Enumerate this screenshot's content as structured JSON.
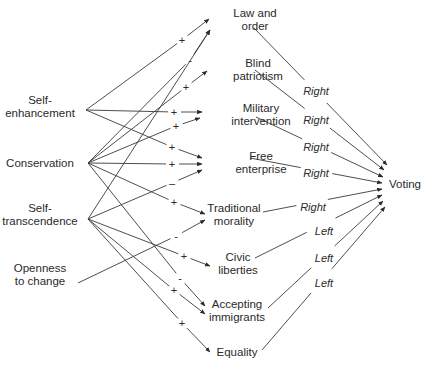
{
  "diagram": {
    "sources": [
      {
        "id": "self_enhancement",
        "lines": [
          "Self-",
          "enhancement"
        ],
        "x": 40,
        "y": 104,
        "px": 86,
        "py": 110
      },
      {
        "id": "conservation",
        "lines": [
          "Conservation"
        ],
        "x": 40,
        "y": 167,
        "px": 88,
        "py": 163
      },
      {
        "id": "self_transcendence",
        "lines": [
          "Self-",
          "transcendence"
        ],
        "x": 40,
        "y": 212,
        "px": 88,
        "py": 219
      },
      {
        "id": "openness",
        "lines": [
          "Openness",
          "to change"
        ],
        "x": 40,
        "y": 272,
        "px": 78,
        "py": 283
      }
    ],
    "values": [
      {
        "id": "law_order",
        "lines": [
          "Law and",
          "order"
        ],
        "x": 255,
        "y": 17
      },
      {
        "id": "blind_patriotism",
        "lines": [
          "Blind",
          "patriotism"
        ],
        "x": 258,
        "y": 67
      },
      {
        "id": "military_intervention",
        "lines": [
          "Military",
          "intervention"
        ],
        "x": 261,
        "y": 112
      },
      {
        "id": "free_enterprise",
        "lines": [
          "Free",
          "enterprise"
        ],
        "x": 261,
        "y": 160
      },
      {
        "id": "traditional_morality",
        "lines": [
          "Traditional",
          "morality"
        ],
        "x": 234,
        "y": 212
      },
      {
        "id": "civic_liberties",
        "lines": [
          "Civic",
          "liberties"
        ],
        "x": 238,
        "y": 261
      },
      {
        "id": "accepting_immigrants",
        "lines": [
          "Accepting",
          "immigrants"
        ],
        "x": 237,
        "y": 308
      },
      {
        "id": "equality",
        "lines": [
          "Equality"
        ],
        "x": 237,
        "y": 356
      }
    ],
    "target": {
      "id": "voting",
      "label": "Voting",
      "x": 405,
      "y": 188
    },
    "source_edges": [
      {
        "from": "self_enhancement",
        "to": "law_order",
        "sign": "+",
        "sx": 182,
        "sy": 40,
        "ex": 209,
        "ey": 19
      },
      {
        "from": "conservation",
        "to": "law_order",
        "sign": "-",
        "sx": 190,
        "sy": 60,
        "ex": 210,
        "ey": 30
      },
      {
        "from": "conservation",
        "to": "blind_patriotism",
        "sign": "+",
        "sx": 186,
        "sy": 87,
        "ex": 207,
        "ey": 71
      },
      {
        "from": "self_enhancement",
        "to": "military_intervention",
        "sign": "+",
        "sx": 174,
        "sy": 112,
        "ex": 202,
        "ey": 112
      },
      {
        "from": "conservation",
        "to": "military_intervention",
        "sign": "+",
        "sx": 176,
        "sy": 126,
        "ex": 200,
        "ey": 118
      },
      {
        "from": "self_enhancement",
        "to": "free_enterprise",
        "sign": "+",
        "sx": 172,
        "sy": 147,
        "ex": 202,
        "ey": 158
      },
      {
        "from": "conservation",
        "to": "free_enterprise",
        "sign": "+",
        "sx": 172,
        "sy": 164,
        "ex": 202,
        "ey": 164
      },
      {
        "from": "self_transcendence",
        "to": "free_enterprise",
        "sign": "–",
        "sx": 172,
        "sy": 183,
        "ex": 202,
        "ey": 170
      },
      {
        "from": "conservation",
        "to": "traditional_morality",
        "sign": "+",
        "sx": 174,
        "sy": 202,
        "ex": 205,
        "ey": 214
      },
      {
        "from": "openness",
        "to": "traditional_morality",
        "sign": "-",
        "sx": 176,
        "sy": 236,
        "ex": 205,
        "ey": 220
      },
      {
        "from": "self_transcendence",
        "to": "blind_patriotism",
        "sign": "",
        "sx": 0,
        "sy": 0,
        "ex": 210,
        "ey": 30
      },
      {
        "from": "self_transcendence",
        "to": "civic_liberties",
        "sign": "+",
        "sx": 184,
        "sy": 256,
        "ex": 210,
        "ey": 266
      },
      {
        "from": "conservation",
        "to": "accepting_immigrants",
        "sign": "-",
        "sx": 180,
        "sy": 278,
        "ex": 205,
        "ey": 306
      },
      {
        "from": "self_transcendence",
        "to": "accepting_immigrants",
        "sign": "+",
        "sx": 174,
        "sy": 290,
        "ex": 205,
        "ey": 314
      },
      {
        "from": "self_transcendence",
        "to": "equality",
        "sign": "+",
        "sx": 182,
        "sy": 323,
        "ex": 210,
        "ey": 352
      }
    ],
    "value_edges": [
      {
        "from": "law_order",
        "direction": "Right",
        "lx": 316,
        "ly": 91,
        "x1": 254,
        "y1": 28,
        "x2": 387,
        "y2": 165
      },
      {
        "from": "blind_patriotism",
        "direction": "Right",
        "lx": 316,
        "ly": 120,
        "x1": 255,
        "y1": 70,
        "x2": 384,
        "y2": 170
      },
      {
        "from": "military_intervention",
        "direction": "Right",
        "lx": 316,
        "ly": 147,
        "x1": 256,
        "y1": 117,
        "x2": 383,
        "y2": 177
      },
      {
        "from": "free_enterprise",
        "direction": "Right",
        "lx": 316,
        "ly": 173,
        "x1": 250,
        "y1": 158,
        "x2": 382,
        "y2": 183
      },
      {
        "from": "traditional_morality",
        "direction": "Right",
        "lx": 313,
        "ly": 207,
        "x1": 263,
        "y1": 212,
        "x2": 382,
        "y2": 189
      },
      {
        "from": "civic_liberties",
        "direction": "Left",
        "lx": 324,
        "ly": 231,
        "x1": 255,
        "y1": 258,
        "x2": 382,
        "y2": 195
      },
      {
        "from": "accepting_immigrants",
        "direction": "Left",
        "lx": 324,
        "ly": 258,
        "x1": 268,
        "y1": 308,
        "x2": 383,
        "y2": 201
      },
      {
        "from": "equality",
        "direction": "Left",
        "lx": 324,
        "ly": 283,
        "x1": 262,
        "y1": 350,
        "x2": 385,
        "y2": 207
      }
    ]
  }
}
